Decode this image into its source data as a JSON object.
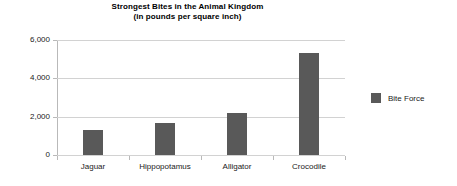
{
  "chart_data": {
    "type": "bar",
    "title": "Strongest Bites in the Animal Kingdom",
    "subtitle": "(in pounds per square inch)",
    "xlabel": "",
    "ylabel": "",
    "categories": [
      "Jaguar",
      "Hippopotamus",
      "Alligator",
      "Crocodile"
    ],
    "series": [
      {
        "name": "Bite Force",
        "values": [
          1300,
          1660,
          2180,
          5300
        ],
        "color": "#595959"
      }
    ],
    "ylim": [
      0,
      6000
    ],
    "yticks": [
      0,
      2000,
      4000,
      6000
    ],
    "ytick_labels": [
      "0",
      "2,000",
      "4,000",
      "6,000"
    ],
    "grid": true,
    "legend_position": "right",
    "legend_entries": [
      "Bite Force"
    ]
  },
  "colors": {
    "bar": "#595959",
    "gridline": "#d2d2d2",
    "axis": "#b9b9b9",
    "background": "#ffffff",
    "text": "#1a1a1a"
  }
}
